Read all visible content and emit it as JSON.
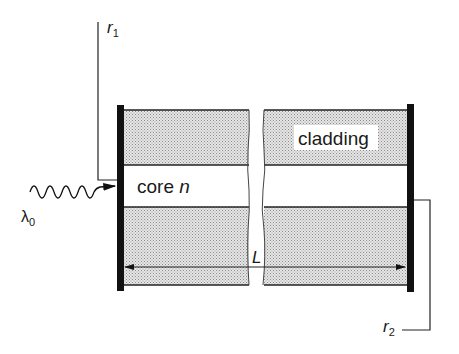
{
  "diagram": {
    "type": "fabry-perot fiber cavity",
    "labels": {
      "r1": "r",
      "r1_sub": "1",
      "r2": "r",
      "r2_sub": "2",
      "cladding": "cladding",
      "core": "core ",
      "core_index": "n",
      "wavelength": "λ",
      "wavelength_sub": "0",
      "length": "L"
    },
    "colors": {
      "mirror": "#111111",
      "cladding_fill": "#d4d4d4",
      "line": "#222222",
      "background": "#ffffff"
    }
  }
}
